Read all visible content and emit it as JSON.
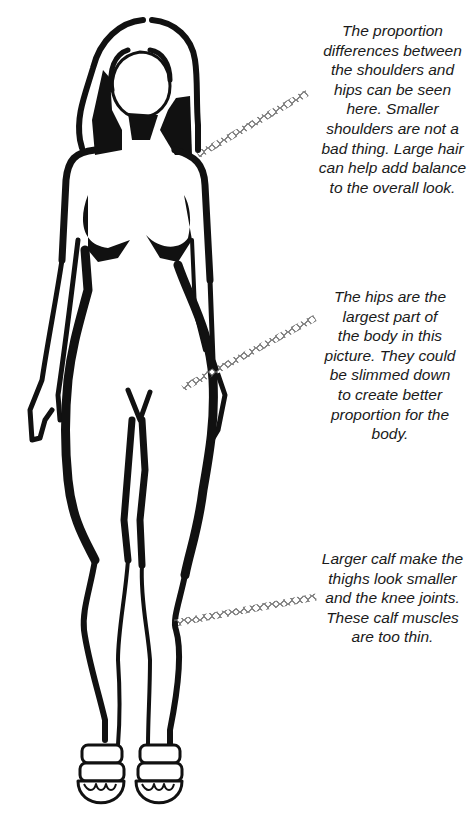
{
  "illustration": {
    "subject": "female-figure-front-view",
    "ink_color": "#111111",
    "leader_color": "#555555"
  },
  "annotations": [
    {
      "id": "shoulders",
      "lines": [
        "The proportion",
        "differences between",
        "the shoulders and",
        "hips can be seen",
        "here. Smaller",
        "shoulders are not a",
        "bad thing. Large hair",
        "can help add balance",
        "to the overall look."
      ]
    },
    {
      "id": "hips",
      "lines": [
        "The hips are the",
        "largest part of",
        "the body in this",
        "picture. They could",
        "be slimmed down",
        "to create better",
        "proportion for the",
        "body."
      ]
    },
    {
      "id": "calves",
      "lines": [
        "Larger calf make the",
        "thighs look smaller",
        "and the knee joints.",
        "These calf muscles",
        "are too thin."
      ]
    }
  ]
}
